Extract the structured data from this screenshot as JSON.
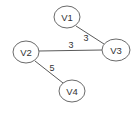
{
  "graph": {
    "nodes": [
      {
        "id": "V1",
        "label": "V1",
        "cx": 67,
        "cy": 17,
        "rx": 13,
        "ry": 11
      },
      {
        "id": "V2",
        "label": "V2",
        "cx": 26,
        "cy": 52,
        "rx": 13,
        "ry": 11
      },
      {
        "id": "V3",
        "label": "V3",
        "cx": 116,
        "cy": 50,
        "rx": 14,
        "ry": 11
      },
      {
        "id": "V4",
        "label": "V4",
        "cx": 72,
        "cy": 91,
        "rx": 13,
        "ry": 11
      }
    ],
    "edges": [
      {
        "from": "V1",
        "to": "V3",
        "weight": "3",
        "x1": 76,
        "y1": 26,
        "x2": 104,
        "y2": 44,
        "lx": 86,
        "ly": 38
      },
      {
        "from": "V2",
        "to": "V3",
        "weight": "3",
        "x1": 39,
        "y1": 51,
        "x2": 102,
        "y2": 50,
        "lx": 71,
        "ly": 45
      },
      {
        "from": "V2",
        "to": "V4",
        "weight": "5",
        "x1": 35,
        "y1": 61,
        "x2": 63,
        "y2": 83,
        "lx": 52,
        "ly": 68
      }
    ],
    "colors": {
      "stroke": "#6a6a6a",
      "text": "#333333",
      "background": "#ffffff"
    }
  }
}
